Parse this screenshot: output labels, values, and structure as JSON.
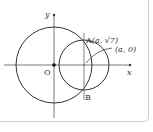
{
  "diagram": {
    "axes": {
      "x_label": "x",
      "y_label": "y",
      "origin_label": "O"
    },
    "points": {
      "A": {
        "label": "A",
        "coords": "(a, √7)"
      },
      "B": {
        "label": "B"
      },
      "center": {
        "coords": "(a, 0)"
      }
    },
    "elements": [
      "circle centered at origin O",
      "circle centered at (a, 0)",
      "vertical line x = a through A and B"
    ],
    "colors": {
      "stroke": "#333333",
      "axis": "#555555",
      "frame": "#cfcfcf"
    }
  }
}
